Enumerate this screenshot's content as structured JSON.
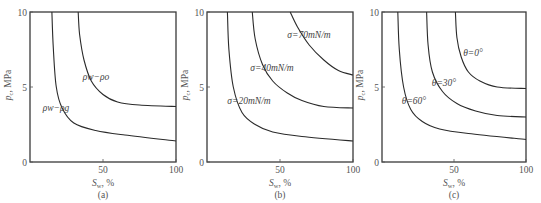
{
  "figure": {
    "panels": [
      {
        "id": "a",
        "caption": "(a)",
        "ylabel": "p_c, MPa",
        "ylabel_text": "p c ,  MPa",
        "xlabel_text": "S w ,  %",
        "yticks": [
          "0",
          "5",
          "10"
        ],
        "xticks": [
          "50",
          "100"
        ]
      },
      {
        "id": "b",
        "caption": "(b)",
        "ylabel_text": "p c ,  MPa",
        "xlabel_text": "S w ,  %",
        "yticks": [
          "0",
          "5",
          "10"
        ],
        "xticks": [
          "50",
          "100"
        ]
      },
      {
        "id": "c",
        "caption": "(c)",
        "ylabel_text": "p c ,  MPa",
        "xlabel_text": "S w ,  %",
        "yticks": [
          "0",
          "5",
          "10"
        ],
        "xticks": [
          "50",
          "100"
        ]
      }
    ]
  },
  "chart_data": [
    {
      "type": "line",
      "title": "(a)",
      "xlabel": "S_w, %",
      "ylabel": "p_c, MPa",
      "xlim": [
        0,
        100
      ],
      "ylim": [
        0,
        10
      ],
      "grid": false,
      "series": [
        {
          "name": "ρw−ρo",
          "x": [
            33,
            34,
            37,
            42,
            50,
            60,
            75,
            100
          ],
          "y": [
            10,
            8.5,
            6.8,
            5.4,
            4.5,
            4.0,
            3.8,
            3.7
          ]
        },
        {
          "name": "ρw−ρg",
          "x": [
            15,
            16,
            18,
            22,
            30,
            45,
            65,
            100
          ],
          "y": [
            10,
            7.5,
            5.0,
            3.6,
            2.6,
            2.1,
            1.8,
            1.4
          ]
        }
      ],
      "annotations": [
        "ρw−ρo",
        "ρw−ρg"
      ]
    },
    {
      "type": "line",
      "title": "(b)",
      "xlabel": "S_w, %",
      "ylabel": "p_c, MPa",
      "xlim": [
        0,
        100
      ],
      "ylim": [
        0,
        10
      ],
      "grid": false,
      "series": [
        {
          "name": "σ=70mN/m",
          "x": [
            57,
            62,
            70,
            80,
            90,
            100
          ],
          "y": [
            10,
            9.0,
            7.8,
            6.8,
            6.1,
            5.8
          ]
        },
        {
          "name": "σ=40mN/m",
          "x": [
            31,
            33,
            38,
            45,
            55,
            65,
            80,
            100
          ],
          "y": [
            10,
            8.2,
            6.5,
            5.4,
            4.6,
            4.1,
            3.7,
            3.6
          ]
        },
        {
          "name": "σ=20mN/m",
          "x": [
            14,
            15,
            18,
            24,
            33,
            45,
            65,
            100
          ],
          "y": [
            10,
            7.5,
            5.0,
            3.3,
            2.5,
            2.0,
            1.7,
            1.4
          ]
        }
      ],
      "annotations": [
        "σ=70mN/m",
        "σ=40mN/m",
        "σ=20mN/m"
      ]
    },
    {
      "type": "line",
      "title": "(c)",
      "xlabel": "S_w, %",
      "ylabel": "p_c, MPa",
      "xlim": [
        0,
        100
      ],
      "ylim": [
        0,
        10
      ],
      "grid": false,
      "series": [
        {
          "name": "θ=0°",
          "x": [
            51,
            52,
            55,
            60,
            68,
            80,
            100
          ],
          "y": [
            10,
            8.3,
            7.0,
            6.0,
            5.4,
            5.0,
            4.9
          ]
        },
        {
          "name": "θ=30°",
          "x": [
            31,
            32,
            35,
            42,
            52,
            65,
            80,
            100
          ],
          "y": [
            10,
            7.8,
            6.0,
            4.7,
            3.9,
            3.4,
            3.1,
            3.0
          ]
        },
        {
          "name": "θ=60°",
          "x": [
            11,
            12,
            15,
            20,
            28,
            40,
            60,
            100
          ],
          "y": [
            10,
            7.5,
            5.0,
            3.5,
            2.7,
            2.2,
            1.9,
            1.5
          ]
        }
      ],
      "annotations": [
        "θ=0°",
        "θ=30°",
        "θ=60°"
      ]
    }
  ]
}
